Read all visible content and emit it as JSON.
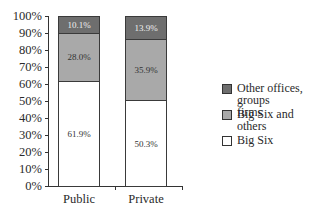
{
  "chart_data": {
    "type": "bar",
    "stacked": true,
    "title": "",
    "xlabel": "",
    "ylabel": "",
    "ylim": [
      0,
      100
    ],
    "yticks": [
      "0%",
      "10%",
      "20%",
      "30%",
      "40%",
      "50%",
      "60%",
      "70%",
      "80%",
      "90%",
      "100%"
    ],
    "categories": [
      "Public",
      "Private"
    ],
    "series": [
      {
        "name": "Big Six",
        "values": [
          61.9,
          50.3
        ],
        "labels": [
          "61.9%",
          "50.3%"
        ],
        "color": "#ffffff"
      },
      {
        "name": "Big Six and others",
        "values": [
          28.0,
          35.9
        ],
        "labels": [
          "28.0%",
          "35.9%"
        ],
        "color": "#a9a9a9"
      },
      {
        "name": "Other offices, groups firms",
        "values": [
          10.1,
          13.9
        ],
        "labels": [
          "10.1%",
          "13.9%"
        ],
        "color": "#6e6e6e"
      }
    ],
    "legend_position": "right",
    "grid": false
  },
  "legend": {
    "items": [
      {
        "line1": "Other offices, groups",
        "line2": "firms",
        "color": "#6e6e6e"
      },
      {
        "line1": "Big Six and others",
        "line2": "",
        "color": "#a9a9a9"
      },
      {
        "line1": "Big Six",
        "line2": "",
        "color": "#ffffff"
      }
    ]
  }
}
